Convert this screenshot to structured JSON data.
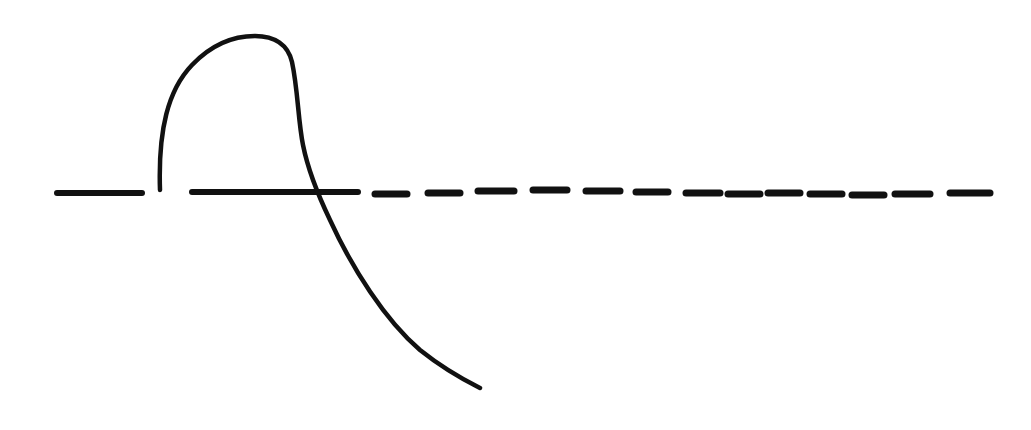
{
  "diagram": {
    "type": "hand-drawn-sketch",
    "background": "#ffffff",
    "stroke_color": "#111111",
    "baseline": {
      "style": "dashed",
      "y": 193,
      "solid_segments": [
        [
          57,
          142
        ],
        [
          192,
          358
        ]
      ],
      "dashes": [
        [
          375,
          407
        ],
        [
          428,
          460
        ],
        [
          478,
          514
        ],
        [
          533,
          567
        ],
        [
          586,
          620
        ],
        [
          636,
          668
        ],
        [
          686,
          720
        ],
        [
          728,
          760
        ],
        [
          768,
          800
        ],
        [
          810,
          842
        ],
        [
          852,
          884
        ],
        [
          895,
          930
        ],
        [
          950,
          990
        ]
      ]
    },
    "curve": {
      "description": "loop rising from baseline, peaking near top, then descending across the baseline to lower right",
      "start": [
        160,
        190
      ],
      "peak": [
        250,
        35
      ],
      "crossing": [
        315,
        193
      ],
      "end": [
        480,
        388
      ]
    }
  }
}
